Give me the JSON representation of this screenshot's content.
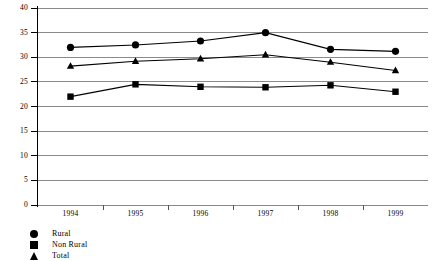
{
  "chart_data": {
    "type": "line",
    "title": "",
    "xlabel": "",
    "ylabel": "",
    "categories": [
      "1994",
      "1995",
      "1996",
      "1997",
      "1998",
      "1999"
    ],
    "ylim": [
      0,
      40
    ],
    "yticks": [
      0,
      5,
      10,
      15,
      20,
      25,
      30,
      35,
      40
    ],
    "grid": true,
    "legend_position": "bottom-left",
    "series": [
      {
        "name": "Rural",
        "marker": "circle",
        "values": [
          32.0,
          32.5,
          33.3,
          35.0,
          31.6,
          31.2
        ]
      },
      {
        "name": "Non Rural",
        "marker": "square",
        "values": [
          22.0,
          24.5,
          24.0,
          23.9,
          24.3,
          23.0
        ]
      },
      {
        "name": "Total",
        "marker": "triangle",
        "values": [
          28.2,
          29.2,
          29.7,
          30.5,
          29.0,
          27.3
        ]
      }
    ]
  },
  "axis": {
    "y_tick_labels": [
      "0",
      "5",
      "10",
      "15",
      "20",
      "25",
      "30",
      "35",
      "40"
    ],
    "x_tick_labels": [
      "1994",
      "1995",
      "1996",
      "1997",
      "1998",
      "1999"
    ]
  },
  "legend": {
    "items": [
      {
        "label": "Rural",
        "marker": "circle"
      },
      {
        "label": "Non Rural",
        "marker": "square"
      },
      {
        "label": "Total",
        "marker": "triangle"
      }
    ]
  }
}
